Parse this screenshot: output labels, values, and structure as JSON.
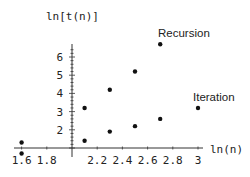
{
  "chart_data": {
    "type": "scatter",
    "title": "",
    "xlabel": "ln(n)",
    "ylabel": "ln[t(n)]",
    "xlim": [
      1.55,
      3.05
    ],
    "ylim": [
      0.5,
      7
    ],
    "x_axis_crosses_y_at": 1,
    "y_axis_crosses_x_at": 2.0,
    "grid": false,
    "legend": "inline labels",
    "x_ticks": [
      "1.6",
      "1.8",
      "2.2",
      "2.4",
      "2.6",
      "2.8",
      "3"
    ],
    "y_ticks": [
      "2",
      "3",
      "4",
      "5",
      "6"
    ],
    "series": [
      {
        "name": "Recursion",
        "points": [
          [
            1.6,
            1.3
          ],
          [
            2.1,
            3.2
          ],
          [
            2.3,
            4.2
          ],
          [
            2.5,
            5.2
          ],
          [
            2.7,
            6.7
          ]
        ]
      },
      {
        "name": "Iteration",
        "points": [
          [
            1.6,
            0.7
          ],
          [
            2.1,
            1.4
          ],
          [
            2.3,
            1.9
          ],
          [
            2.5,
            2.2
          ],
          [
            2.7,
            2.6
          ],
          [
            3.0,
            3.2
          ]
        ]
      }
    ]
  },
  "labels": {
    "xlabel": "ln(n)",
    "ylabel": "ln[t(n)]",
    "recursion": "Recursion",
    "iteration": "Iteration"
  }
}
